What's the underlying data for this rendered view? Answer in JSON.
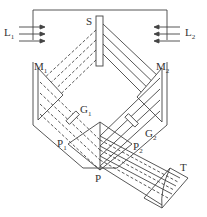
{
  "diagram": {
    "type": "optical-schematic",
    "colors": {
      "line": "#444444",
      "background": "#ffffff"
    },
    "labels": {
      "L1": {
        "base": "L",
        "sub": "1"
      },
      "L2": {
        "base": "L",
        "sub": "2"
      },
      "S": {
        "base": "S",
        "sub": ""
      },
      "M1": {
        "base": "M",
        "sub": "1"
      },
      "M2": {
        "base": "M",
        "sub": "2"
      },
      "G1": {
        "base": "G",
        "sub": "1"
      },
      "G2": {
        "base": "G",
        "sub": "2"
      },
      "P1": {
        "base": "P",
        "sub": "1"
      },
      "P2": {
        "base": "P",
        "sub": "2"
      },
      "P": {
        "base": "P",
        "sub": ""
      },
      "T": {
        "base": "T",
        "sub": ""
      }
    }
  }
}
